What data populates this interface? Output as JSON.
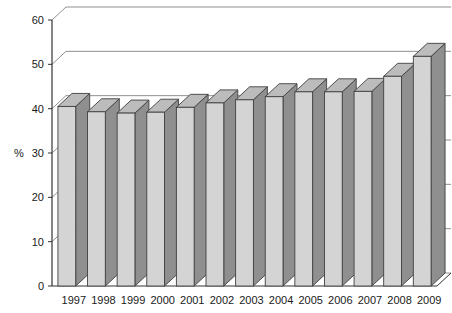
{
  "chart_data": {
    "type": "bar",
    "title": "",
    "subtitle": "",
    "xlabel": "",
    "ylabel": "%",
    "categories": [
      "1997",
      "1998",
      "1999",
      "2000",
      "2001",
      "2002",
      "2003",
      "2004",
      "2005",
      "2006",
      "2007",
      "2008",
      "2009"
    ],
    "values": [
      40.5,
      39.3,
      39.0,
      39.2,
      40.3,
      41.3,
      42.0,
      42.7,
      43.8,
      43.8,
      43.9,
      47.3,
      51.8
    ],
    "series": [
      {
        "name": "",
        "values": [
          40.5,
          39.3,
          39.0,
          39.2,
          40.3,
          41.3,
          42.0,
          42.7,
          43.8,
          43.8,
          43.9,
          47.3,
          51.8
        ]
      }
    ],
    "ylim": [
      0,
      60
    ],
    "yticks": [
      0,
      10,
      20,
      30,
      40,
      50,
      60
    ],
    "ytick_labels": [
      "0",
      "10",
      "20",
      "30",
      "40",
      "50",
      "60"
    ],
    "grid": true,
    "grid_axis": "y",
    "legend": false,
    "legend_position": "none",
    "style": "3d-column",
    "annotations": []
  },
  "colors": {
    "bar_front": "#d4d4d4",
    "bar_side": "#8f8f8f",
    "bar_top": "#bcbcbc",
    "bar_outline": "#404040",
    "gridline": "#909090",
    "axis": "#333333",
    "text": "#1a1a1a",
    "background": "#ffffff",
    "floor": "#ffffff"
  }
}
